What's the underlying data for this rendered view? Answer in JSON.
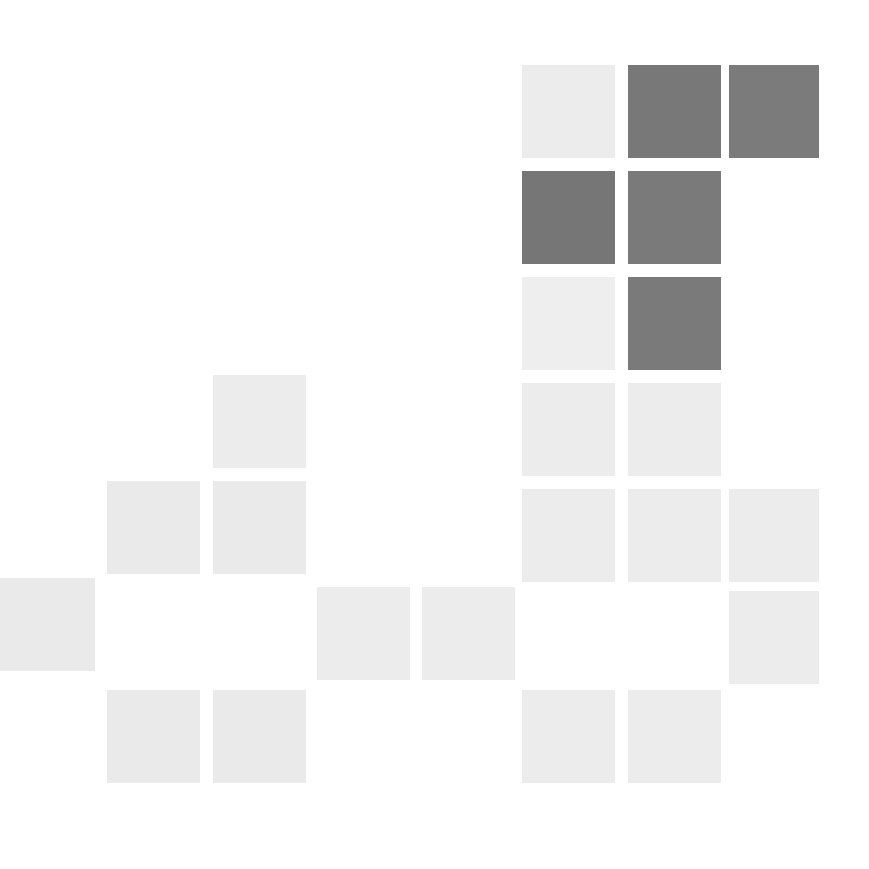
{
  "figure": {
    "background_color": "#ffffff",
    "width": 869,
    "height": 869
  },
  "chart_data": {
    "type": "heatmap",
    "title": "",
    "subtitle": "",
    "xlabel": "",
    "ylabel": "",
    "legend": [],
    "annotations": [],
    "grid": false,
    "axis_visible": false,
    "tick_labels_x": [],
    "tick_labels_y": [],
    "n_cols": 8,
    "n_rows": 7,
    "cell_size_px": 93,
    "cell_pitch_px": 106,
    "origin_x_px": 4,
    "origin_y_px": 65,
    "value_scale": {
      "min": 0,
      "max": 1,
      "colormap": "greys",
      "empty_color": "#ffffff",
      "low_color": "#ededed",
      "mid_color": "#ebebeb",
      "high_color": "#7b7b7b"
    },
    "color_levels": {
      "empty": "#ffffff",
      "very_light": "#ececec",
      "light": "#eaeaea",
      "lighter": "#ededed",
      "dark": "#7b7b7b",
      "darker": "#767676"
    },
    "matrix": [
      [
        null,
        null,
        null,
        null,
        null,
        0.07,
        0.72,
        0.7
      ],
      [
        null,
        null,
        null,
        null,
        null,
        0.74,
        0.71,
        null
      ],
      [
        null,
        null,
        null,
        null,
        null,
        0.05,
        0.71,
        null
      ],
      [
        null,
        null,
        0.08,
        null,
        null,
        0.08,
        0.08,
        null
      ],
      [
        null,
        0.09,
        0.09,
        null,
        null,
        0.09,
        0.09,
        0.09
      ],
      [
        0.09,
        null,
        null,
        0.09,
        0.09,
        null,
        null,
        0.09
      ],
      [
        null,
        0.09,
        0.09,
        null,
        null,
        0.09,
        0.09,
        null
      ]
    ],
    "cells": [
      {
        "id": "cell-r0-c5",
        "row": 0,
        "col": 5,
        "value": 0.07,
        "color": "#ececec",
        "x": 522,
        "y": 65,
        "w": 93,
        "h": 93
      },
      {
        "id": "cell-r0-c6",
        "row": 0,
        "col": 6,
        "value": 0.72,
        "color": "#787878",
        "x": 628,
        "y": 65,
        "w": 93,
        "h": 93
      },
      {
        "id": "cell-r0-c7",
        "row": 0,
        "col": 7,
        "value": 0.7,
        "color": "#7b7b7b",
        "x": 729,
        "y": 65,
        "w": 90,
        "h": 93
      },
      {
        "id": "cell-r1-c5",
        "row": 1,
        "col": 5,
        "value": 0.74,
        "color": "#767676",
        "x": 522,
        "y": 171,
        "w": 93,
        "h": 93
      },
      {
        "id": "cell-r1-c6",
        "row": 1,
        "col": 6,
        "value": 0.71,
        "color": "#7a7a7a",
        "x": 628,
        "y": 171,
        "w": 93,
        "h": 93
      },
      {
        "id": "cell-r2-c5",
        "row": 2,
        "col": 5,
        "value": 0.05,
        "color": "#eeeeee",
        "x": 522,
        "y": 277,
        "w": 93,
        "h": 93
      },
      {
        "id": "cell-r2-c6",
        "row": 2,
        "col": 6,
        "value": 0.71,
        "color": "#7a7a7a",
        "x": 628,
        "y": 277,
        "w": 93,
        "h": 93
      },
      {
        "id": "cell-r3-c2",
        "row": 3,
        "col": 2,
        "value": 0.08,
        "color": "#ececec",
        "x": 213,
        "y": 375,
        "w": 93,
        "h": 93
      },
      {
        "id": "cell-r3-c5",
        "row": 3,
        "col": 5,
        "value": 0.08,
        "color": "#ececec",
        "x": 522,
        "y": 383,
        "w": 93,
        "h": 93
      },
      {
        "id": "cell-r3-c6",
        "row": 3,
        "col": 6,
        "value": 0.08,
        "color": "#ececec",
        "x": 628,
        "y": 383,
        "w": 93,
        "h": 93
      },
      {
        "id": "cell-r4-c1",
        "row": 4,
        "col": 1,
        "value": 0.09,
        "color": "#eaeaea",
        "x": 107,
        "y": 481,
        "w": 93,
        "h": 93
      },
      {
        "id": "cell-r4-c2",
        "row": 4,
        "col": 2,
        "value": 0.09,
        "color": "#eaeaea",
        "x": 213,
        "y": 481,
        "w": 93,
        "h": 93
      },
      {
        "id": "cell-r4-c5",
        "row": 4,
        "col": 5,
        "value": 0.09,
        "color": "#ececec",
        "x": 522,
        "y": 489,
        "w": 93,
        "h": 93
      },
      {
        "id": "cell-r4-c6",
        "row": 4,
        "col": 6,
        "value": 0.09,
        "color": "#ececec",
        "x": 628,
        "y": 489,
        "w": 93,
        "h": 93
      },
      {
        "id": "cell-r4-c7",
        "row": 4,
        "col": 7,
        "value": 0.09,
        "color": "#ececec",
        "x": 729,
        "y": 489,
        "w": 90,
        "h": 93
      },
      {
        "id": "cell-r5-c0",
        "row": 5,
        "col": 0,
        "value": 0.09,
        "color": "#eaeaea",
        "x": -8,
        "y": 578,
        "w": 103,
        "h": 93
      },
      {
        "id": "cell-r5-c3",
        "row": 5,
        "col": 3,
        "value": 0.09,
        "color": "#ececec",
        "x": 317,
        "y": 587,
        "w": 93,
        "h": 93
      },
      {
        "id": "cell-r5-c4",
        "row": 5,
        "col": 4,
        "value": 0.09,
        "color": "#ececec",
        "x": 422,
        "y": 587,
        "w": 93,
        "h": 93
      },
      {
        "id": "cell-r5-c7",
        "row": 5,
        "col": 7,
        "value": 0.09,
        "color": "#ececec",
        "x": 729,
        "y": 591,
        "w": 90,
        "h": 93
      },
      {
        "id": "cell-r6-c1",
        "row": 6,
        "col": 1,
        "value": 0.09,
        "color": "#eaeaea",
        "x": 107,
        "y": 690,
        "w": 93,
        "h": 93
      },
      {
        "id": "cell-r6-c2",
        "row": 6,
        "col": 2,
        "value": 0.09,
        "color": "#eaeaea",
        "x": 213,
        "y": 690,
        "w": 93,
        "h": 93
      },
      {
        "id": "cell-r6-c5",
        "row": 6,
        "col": 5,
        "value": 0.09,
        "color": "#ececec",
        "x": 522,
        "y": 690,
        "w": 93,
        "h": 93
      },
      {
        "id": "cell-r6-c6",
        "row": 6,
        "col": 6,
        "value": 0.09,
        "color": "#ececec",
        "x": 628,
        "y": 690,
        "w": 93,
        "h": 93
      }
    ]
  }
}
